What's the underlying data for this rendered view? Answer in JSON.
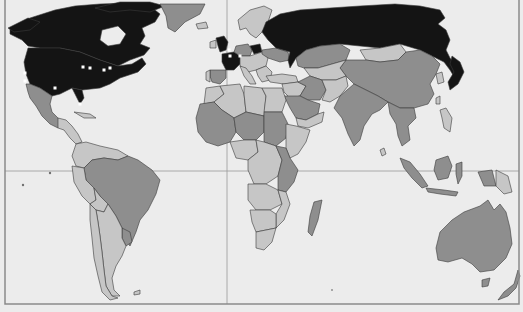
{
  "map": {
    "type": "choropleth-world-map",
    "projection": "equirectangular-like",
    "palette": {
      "background": "#ececec",
      "high": "#141414",
      "medium": "#8e8e8e",
      "low": "#c6c6c6",
      "ice": "#bdbdbd",
      "city_marker": "#ffffff"
    },
    "legend": null,
    "categories": {
      "high": [
        "Canada",
        "United States",
        "Russia",
        "France",
        "United Kingdom",
        "Germany"
      ],
      "medium": [
        "Greenland",
        "Mexico",
        "Brazil",
        "Uruguay",
        "China",
        "India",
        "Kazakhstan",
        "Saudi Arabia",
        "Iran",
        "Australia",
        "New Zealand",
        "Indonesia",
        "Malaysia",
        "Spain",
        "Sudan",
        "Tanzania",
        "Madagascar",
        "South Africa"
      ],
      "low": [
        "Argentina",
        "Chile",
        "Peru",
        "Mongolia",
        "Egypt",
        "Libya",
        "Algeria",
        "Ethiopia",
        "Papua New Guinea",
        "Scandinavia"
      ]
    },
    "city_markers": [
      {
        "name": "Seattle"
      },
      {
        "name": "San Francisco"
      },
      {
        "name": "Dallas"
      },
      {
        "name": "Chicago"
      },
      {
        "name": "Detroit"
      },
      {
        "name": "Pittsburgh"
      },
      {
        "name": "New York"
      },
      {
        "name": "Miami"
      },
      {
        "name": "London"
      },
      {
        "name": "Paris"
      },
      {
        "name": "Zurich"
      }
    ]
  }
}
